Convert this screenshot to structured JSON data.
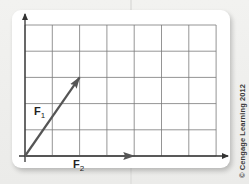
{
  "diagram": {
    "grid": {
      "columns": 7,
      "rows": 5
    },
    "axes": {
      "x_arrow": true,
      "y_arrow": true
    },
    "vectors": [
      {
        "id": "F1",
        "label": "F",
        "subscript": "1",
        "dx": 2,
        "dy": 3,
        "color": "#555555"
      },
      {
        "id": "F2",
        "label": "F",
        "subscript": "2",
        "dx": 4,
        "dy": 0,
        "color": "#555555"
      }
    ],
    "colors": {
      "grid": "#7a7a7a",
      "axis": "#333333",
      "panel": "#ffffff"
    }
  },
  "copyright": "© Cengage Learning 2012"
}
